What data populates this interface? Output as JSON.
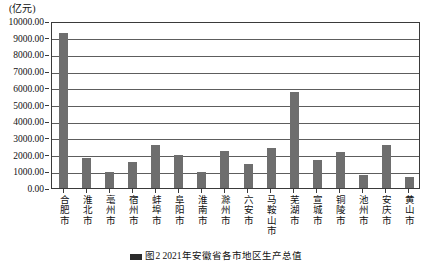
{
  "unit_label": "(亿元)",
  "caption": "图2  2021年安徽省各市地区生产总值",
  "chart_data": {
    "type": "bar",
    "title": "",
    "subtitle": "",
    "xlabel": "",
    "ylabel": "(亿元)",
    "ylim": [
      0,
      10000
    ],
    "ytick_step": 1000,
    "grid": true,
    "legend_position": "none",
    "bar_color": "#6e6e6e",
    "axis_color": "#3a3a3a",
    "categories": [
      "合肥市",
      "淮北市",
      "亳州市",
      "宿州市",
      "蚌埠市",
      "阜阳市",
      "淮南市",
      "滁州市",
      "六安市",
      "马鞍山市",
      "芜湖市",
      "宣城市",
      "铜陵市",
      "池州市",
      "安庆市",
      "黄山市"
    ],
    "values": [
      9300.0,
      1800.0,
      950.0,
      1550.0,
      2550.0,
      1950.0,
      950.0,
      2200.0,
      1450.0,
      2400.0,
      5750.0,
      1650.0,
      2150.0,
      800.0,
      2550.0,
      650.0
    ],
    "ytick_labels": [
      "0.00",
      "1000.00",
      "2000.00",
      "3000.00",
      "4000.00",
      "5000.00",
      "6000.00",
      "7000.00",
      "8000.00",
      "9000.00",
      "10000.00"
    ],
    "ytick_values": [
      0,
      1000,
      2000,
      3000,
      4000,
      5000,
      6000,
      7000,
      8000,
      9000,
      10000
    ]
  }
}
